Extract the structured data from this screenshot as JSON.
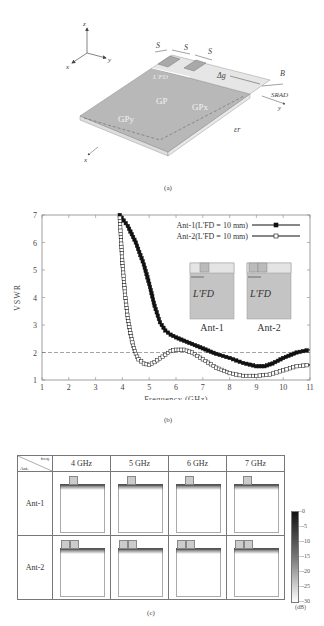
{
  "figure_a": {
    "caption": "(a)",
    "axes": {
      "x": "x",
      "y": "y",
      "z": "z"
    },
    "labels": {
      "s1": "S",
      "s2": "S",
      "s3": "S",
      "lfd": "L'FD",
      "dg": "Δg",
      "b": "B",
      "srad": "SRAD",
      "gp": "GP",
      "gpx": "GPx",
      "gpy": "GPy",
      "er": "εr",
      "board_x": "x",
      "board_y": "y"
    }
  },
  "figure_b": {
    "caption": "(b)"
  },
  "figure_c": {
    "caption": "(c)",
    "corner_top": "freq.",
    "corner_bottom": "Ant.",
    "columns": [
      "4 GHz",
      "5 GHz",
      "6 GHz",
      "7 GHz"
    ],
    "rows": [
      "Ant-1",
      "Ant-2"
    ],
    "colorbar": {
      "ticks": [
        "0",
        "-5",
        "-10",
        "-15",
        "-20",
        "-25",
        "-30"
      ],
      "unit": "(dB)"
    }
  },
  "chart_data": {
    "type": "line",
    "title": "",
    "xlabel": "Frequency (GHz)",
    "ylabel": "VSWR",
    "xlim": [
      1,
      11
    ],
    "ylim": [
      1,
      7
    ],
    "xticks": [
      "1",
      "2",
      "3",
      "4",
      "5",
      "6",
      "7",
      "8",
      "9",
      "10",
      "11"
    ],
    "yticks": [
      "1",
      "2",
      "3",
      "4",
      "5",
      "6",
      "7"
    ],
    "reference_line": {
      "y": 2,
      "style": "dashed"
    },
    "legend_position": "upper right",
    "series": [
      {
        "name": "Ant-1(L'FD = 10 mm)",
        "marker": "filled-square",
        "x": [
          3.9,
          4.2,
          4.5,
          4.8,
          5.0,
          5.2,
          5.4,
          5.6,
          5.8,
          6.0,
          6.5,
          7.0,
          7.5,
          8.0,
          8.5,
          9.0,
          9.3,
          9.6,
          10.0,
          10.5,
          11.0
        ],
        "y": [
          7.0,
          6.6,
          6.0,
          5.2,
          4.5,
          3.7,
          3.1,
          2.8,
          2.65,
          2.55,
          2.35,
          2.15,
          1.95,
          1.8,
          1.62,
          1.5,
          1.5,
          1.6,
          1.8,
          2.0,
          2.1
        ]
      },
      {
        "name": "Ant-2(L'FD = 10 mm)",
        "marker": "open-square",
        "x": [
          3.9,
          4.0,
          4.1,
          4.2,
          4.3,
          4.4,
          4.5,
          4.6,
          4.8,
          5.0,
          5.2,
          5.5,
          5.8,
          6.0,
          6.3,
          6.6,
          7.0,
          7.5,
          8.0,
          8.5,
          9.0,
          9.5,
          10.0,
          10.5,
          11.0
        ],
        "y": [
          6.9,
          5.25,
          4.1,
          3.25,
          2.7,
          2.25,
          1.95,
          1.75,
          1.6,
          1.55,
          1.65,
          1.85,
          2.05,
          2.1,
          2.1,
          2.0,
          1.75,
          1.45,
          1.25,
          1.15,
          1.15,
          1.2,
          1.35,
          1.5,
          1.55
        ]
      }
    ],
    "insets": [
      {
        "label": "Ant-1",
        "dimension": "L'FD"
      },
      {
        "label": "Ant-2",
        "dimension": "L'FD"
      }
    ]
  }
}
